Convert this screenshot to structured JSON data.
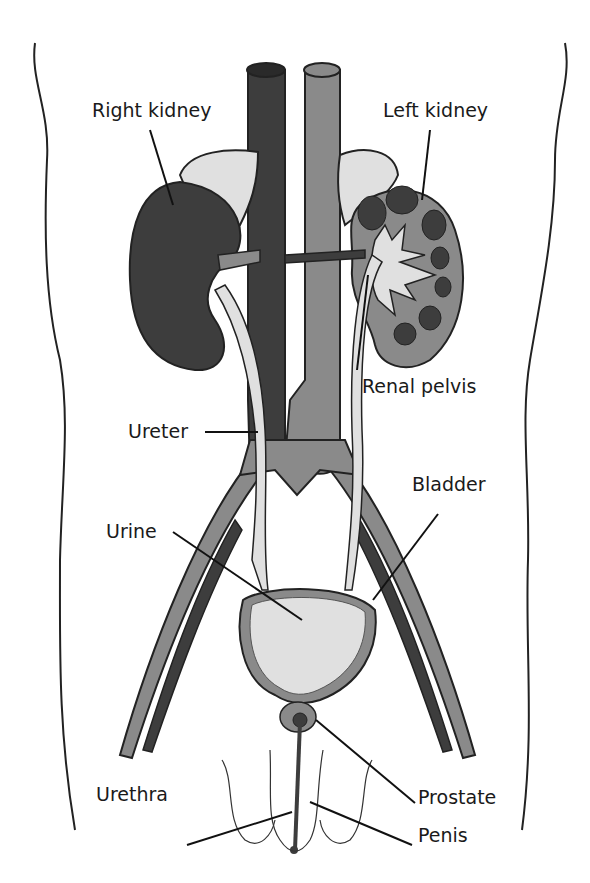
{
  "diagram": {
    "type": "anatomical-illustration",
    "colors": {
      "dark": "#3d3d3d",
      "mid": "#8a8a8a",
      "light": "#c9c9c9",
      "pale": "#e0e0e0",
      "outline": "#222222"
    },
    "labels": {
      "right_kidney": "Right kidney",
      "left_kidney": "Left kidney",
      "renal_pelvis": "Renal pelvis",
      "ureter": "Ureter",
      "bladder": "Bladder",
      "urine": "Urine",
      "urethra": "Urethra",
      "prostate": "Prostate",
      "penis": "Penis"
    }
  }
}
